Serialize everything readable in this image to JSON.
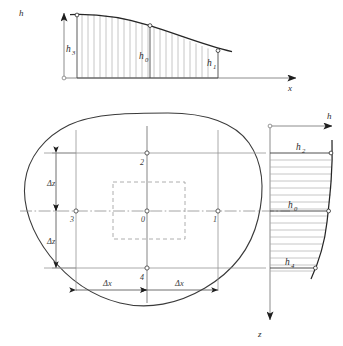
{
  "figure": {
    "background_color": "#ffffff",
    "ink_color": "#2b2b2b",
    "thin_line_color": "#8a8a8a"
  },
  "top_plot": {
    "name": "h-x surface profile",
    "axis_vertical_label": "h",
    "axis_horizontal_label": "x",
    "origin_marker": "open-circle",
    "curve_labels": [
      {
        "id": "h3",
        "base": "h",
        "sub": "3"
      },
      {
        "id": "h0",
        "base": "h",
        "sub": "0"
      },
      {
        "id": "h1",
        "base": "h",
        "sub": "1"
      }
    ],
    "hatch_count": 22
  },
  "plan_view": {
    "name": "plan view with irregular boundary",
    "nodes": [
      {
        "label": "0",
        "position": "center"
      },
      {
        "label": "1",
        "position": "right"
      },
      {
        "label": "2",
        "position": "top"
      },
      {
        "label": "3",
        "position": "left"
      },
      {
        "label": "4",
        "position": "bottom"
      }
    ],
    "dimensions": [
      {
        "id": "dz-upper",
        "base": "Δ",
        "sub": "z",
        "text": "Δz"
      },
      {
        "id": "dz-lower",
        "base": "Δ",
        "sub": "z",
        "text": "Δz"
      },
      {
        "id": "dx-left",
        "base": "Δ",
        "sub": "x",
        "text": "Δx"
      },
      {
        "id": "dx-right",
        "base": "Δ",
        "sub": "x",
        "text": "Δx"
      }
    ],
    "inner_rect_style": "dashed",
    "centerline_style": "dash-dot"
  },
  "right_plot": {
    "name": "h-z depth profile",
    "axis_horizontal_label": "h",
    "axis_vertical_label": "z",
    "origin_marker": "open-circle",
    "curve_labels": [
      {
        "id": "h2",
        "base": "h",
        "sub": "2"
      },
      {
        "id": "h0",
        "base": "h",
        "sub": "0"
      },
      {
        "id": "h4",
        "base": "h",
        "sub": "4"
      }
    ],
    "hatch_count": 17
  }
}
